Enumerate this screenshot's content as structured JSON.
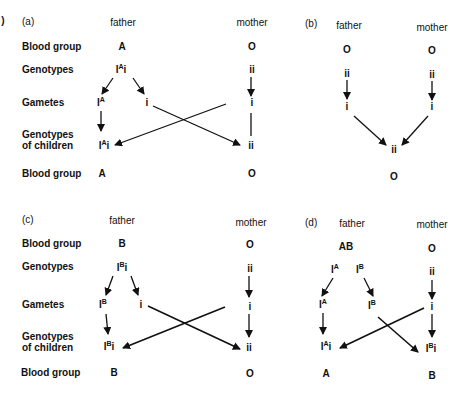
{
  "figure": {
    "corner_mark": ")",
    "row_labels": {
      "blood_group": "Blood group",
      "genotypes": "Genotypes",
      "gametes": "Gametes",
      "genotypes_children_1": "Genotypes",
      "genotypes_children_2": "of children"
    },
    "panels": [
      {
        "id": "a",
        "label": "(a)",
        "father_label": "father",
        "mother_label": "mother",
        "father": {
          "blood_group": "A",
          "genotype": "I^A i",
          "gametes": [
            "I^A",
            "i"
          ]
        },
        "mother": {
          "blood_group": "O",
          "genotype": "ii",
          "gametes": [
            "i"
          ]
        },
        "children": [
          {
            "genotype": "I^A i",
            "blood_group": "A"
          },
          {
            "genotype": "ii",
            "blood_group": "O"
          }
        ]
      },
      {
        "id": "b",
        "label": "(b)",
        "father_label": "father",
        "mother_label": "mother",
        "father": {
          "blood_group": "O",
          "genotype": "ii",
          "gametes": [
            "i"
          ]
        },
        "mother": {
          "blood_group": "O",
          "genotype": "ii",
          "gametes": [
            "i"
          ]
        },
        "children": [
          {
            "genotype": "ii",
            "blood_group": "O"
          }
        ]
      },
      {
        "id": "c",
        "label": "(c)",
        "father_label": "father",
        "mother_label": "mother",
        "father": {
          "blood_group": "B",
          "genotype": "I^B i",
          "gametes": [
            "I^B",
            "i"
          ]
        },
        "mother": {
          "blood_group": "O",
          "genotype": "ii",
          "gametes": [
            "i"
          ]
        },
        "children": [
          {
            "genotype": "I^B i",
            "blood_group": "B"
          },
          {
            "genotype": "ii",
            "blood_group": "O"
          }
        ]
      },
      {
        "id": "d",
        "label": "(d)",
        "father_label": "father",
        "mother_label": "mother",
        "father": {
          "blood_group": "AB",
          "genotype": "I^A I^B",
          "gametes": [
            "I^A",
            "I^B"
          ]
        },
        "mother": {
          "blood_group": "O",
          "genotype": "ii",
          "gametes": [
            "i"
          ]
        },
        "children": [
          {
            "genotype": "I^A i",
            "blood_group": "A"
          },
          {
            "genotype": "I^B i",
            "blood_group": "B"
          }
        ]
      }
    ],
    "text": {
      "I": "I",
      "A": "A",
      "B": "B",
      "i": "i",
      "ii": "ii",
      "O": "O",
      "AB": "AB"
    }
  }
}
